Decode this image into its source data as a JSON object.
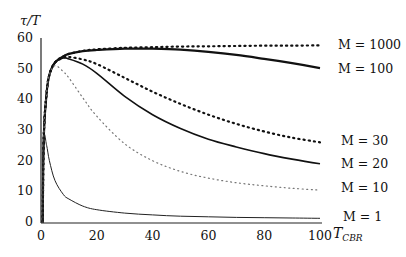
{
  "chart_data": {
    "type": "line",
    "title": "",
    "xlabel": "T_CBR",
    "ylabel": "τ/T",
    "xlim": [
      0,
      100
    ],
    "ylim": [
      0,
      60
    ],
    "xticks": [
      0,
      20,
      40,
      60,
      80,
      100
    ],
    "yticks": [
      0,
      10,
      20,
      30,
      40,
      50,
      60
    ],
    "grid": false,
    "legend_position": "right, inline labels at line ends",
    "x": [
      1,
      2,
      3,
      5,
      8,
      10,
      15,
      20,
      30,
      40,
      50,
      60,
      70,
      80,
      90,
      100
    ],
    "series": [
      {
        "name": "M = 1000",
        "style": "dotted-bold",
        "values": [
          28,
          42,
          48,
          52,
          54,
          54.8,
          55.8,
          56.3,
          56.8,
          57,
          57.2,
          57.3,
          57.4,
          57.5,
          57.5,
          57.6
        ]
      },
      {
        "name": "M = 100",
        "style": "solid-bold",
        "values": [
          28,
          42,
          48,
          52,
          54,
          54.8,
          55.7,
          56.1,
          56.5,
          56.5,
          56.2,
          55.5,
          54.5,
          53.2,
          51.8,
          50.2
        ]
      },
      {
        "name": "M = 30",
        "style": "dotted-bold",
        "values": [
          28,
          42,
          48,
          52,
          53.5,
          53.8,
          53,
          51.5,
          47,
          42.5,
          38.5,
          35,
          32,
          29.5,
          27.5,
          26
        ]
      },
      {
        "name": "M = 20",
        "style": "solid",
        "values": [
          28,
          42,
          48,
          52,
          53.5,
          53.2,
          51.5,
          48.5,
          41,
          35,
          30.5,
          27,
          24.5,
          22.3,
          20.5,
          19
        ]
      },
      {
        "name": "M = 10",
        "style": "dotted-light",
        "values": [
          28,
          42,
          48,
          51,
          49,
          47,
          40.5,
          34.5,
          25.5,
          20,
          16.5,
          14.3,
          12.8,
          11.8,
          11,
          10.4
        ]
      },
      {
        "name": "M = 1",
        "style": "solid-thin",
        "values": [
          27,
          25,
          20,
          13.5,
          9,
          7.5,
          5.2,
          4,
          2.9,
          2.3,
          1.9,
          1.7,
          1.5,
          1.4,
          1.3,
          1.2
        ]
      }
    ],
    "labels": {
      "m1000": "M = 1000",
      "m100": "M = 100",
      "m30": "M = 30",
      "m20": "M = 20",
      "m10": "M = 10",
      "m1": "M = 1"
    }
  }
}
